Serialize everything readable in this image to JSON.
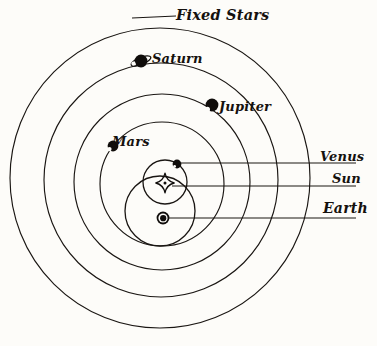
{
  "diagram": {
    "background_color": "#fdfcf9",
    "ink_color": "#15110e",
    "labels": {
      "fixed_stars": "Fixed Stars",
      "saturn": "Saturn",
      "jupiter": "Jupiter",
      "mars": "Mars",
      "venus": "Venus",
      "sun": "Sun",
      "earth": "Earth"
    },
    "orbits": [
      {
        "name": "fixed-stars-sphere",
        "cx": 160,
        "cy": 178,
        "r": 150
      },
      {
        "name": "saturn-orbit",
        "cx": 161,
        "cy": 180,
        "r": 117
      },
      {
        "name": "jupiter-orbit",
        "cx": 162,
        "cy": 182,
        "r": 88
      },
      {
        "name": "mars-orbit",
        "cx": 162,
        "cy": 184,
        "r": 62
      },
      {
        "name": "venus-orbit",
        "cx": 165,
        "cy": 182,
        "r": 22
      },
      {
        "name": "earth-orbit",
        "cx": 160,
        "cy": 211,
        "r": 35
      }
    ],
    "bodies": [
      {
        "name": "saturn",
        "cx": 141,
        "cy": 61,
        "r": 6.5,
        "style": "ringed"
      },
      {
        "name": "jupiter",
        "cx": 212,
        "cy": 105,
        "r": 6.5,
        "style": "crescent"
      },
      {
        "name": "mars",
        "cx": 113,
        "cy": 146,
        "r": 5.5,
        "style": "crescent"
      },
      {
        "name": "venus",
        "cx": 177,
        "cy": 164,
        "r": 4.5,
        "style": "dot"
      },
      {
        "name": "earth",
        "cx": 163,
        "cy": 218,
        "r": 3.2,
        "style": "annulus"
      },
      {
        "name": "sun",
        "cx": 165,
        "cy": 183,
        "r": 9,
        "style": "star"
      }
    ],
    "leader_lines": [
      {
        "name": "venus-leader",
        "x1": 181,
        "y1": 163,
        "x2": 356,
        "y2": 163
      },
      {
        "name": "sun-leader",
        "x1": 172,
        "y1": 186,
        "x2": 356,
        "y2": 186
      },
      {
        "name": "earth-leader",
        "x1": 167,
        "y1": 218,
        "x2": 356,
        "y2": 218
      },
      {
        "name": "fixed-stars-leader",
        "x1": 132,
        "y1": 18,
        "x2": 176,
        "y2": 16
      }
    ]
  }
}
